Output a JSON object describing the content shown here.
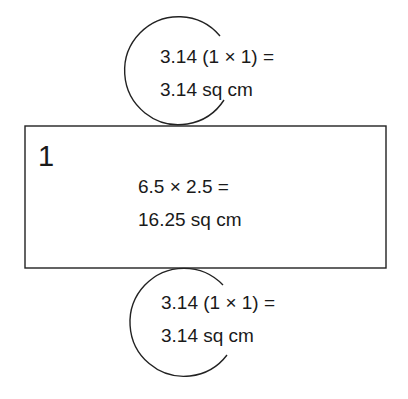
{
  "diagram": {
    "top_circle": {
      "line1": "3.14 (1 × 1) =",
      "line2": "3.14 sq cm"
    },
    "rectangle": {
      "label": "1",
      "line1": "6.5 × 2.5 =",
      "line2": "16.25 sq cm"
    },
    "bottom_circle": {
      "line1": "3.14 (1 × 1) =",
      "line2": "3.14 sq cm"
    }
  }
}
